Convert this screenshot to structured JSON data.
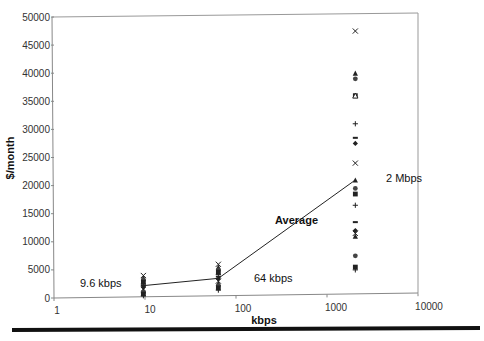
{
  "chart_data": {
    "type": "scatter",
    "title": "",
    "xlabel": "kbps",
    "ylabel": "$/month",
    "xscale": "log",
    "xlim": [
      1,
      10000
    ],
    "ylim": [
      0,
      50000
    ],
    "x_ticks": [
      "1",
      "10",
      "100",
      "1000",
      "10000"
    ],
    "y_ticks": [
      "0",
      "5000",
      "10000",
      "15000",
      "20000",
      "25000",
      "30000",
      "35000",
      "40000",
      "45000",
      "50000"
    ],
    "grid": false,
    "legend": null,
    "series": [
      {
        "name": "9.6 kbps observations",
        "x": 9.6,
        "values": [
          4000,
          3600,
          3200,
          2800,
          2500,
          2200,
          1900,
          1600,
          1300,
          1000,
          700,
          400
        ]
      },
      {
        "name": "64 kbps observations",
        "x": 64,
        "values": [
          6000,
          5500,
          5000,
          4600,
          4200,
          3800,
          3400,
          3000,
          2600,
          2200,
          1800,
          1400
        ]
      },
      {
        "name": "2 Mbps observations",
        "x": 2048,
        "values": [
          47500,
          40000,
          39000,
          36000,
          31000,
          28500,
          27500,
          24000,
          21000,
          19500,
          18500,
          16500,
          13500,
          12000,
          11500,
          11000,
          7500,
          5500,
          5000
        ]
      },
      {
        "name": "Average",
        "type": "line",
        "x": [
          9.6,
          64,
          2048
        ],
        "values": [
          2200,
          3500,
          21000
        ]
      }
    ],
    "annotations": [
      {
        "text": "9.6 kbps",
        "x": 9.6,
        "y": 2200
      },
      {
        "text": "64 kbps",
        "x": 64,
        "y": 3500
      },
      {
        "text": "2 Mbps",
        "x": 2048,
        "y": 21000
      },
      {
        "text": "Average",
        "x": 300,
        "y": 11000
      }
    ]
  }
}
